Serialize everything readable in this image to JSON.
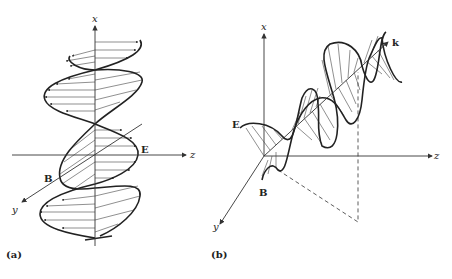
{
  "panels": [
    {
      "id": "a",
      "caption": "(a)",
      "axes": {
        "x": "x",
        "y": "y",
        "z": "z"
      },
      "field_labels": {
        "E": "E",
        "B": "B"
      }
    },
    {
      "id": "b",
      "caption": "(b)",
      "axes": {
        "x": "x",
        "y": "y",
        "z": "z"
      },
      "field_labels": {
        "E": "E",
        "B": "B",
        "k": "k"
      }
    }
  ]
}
